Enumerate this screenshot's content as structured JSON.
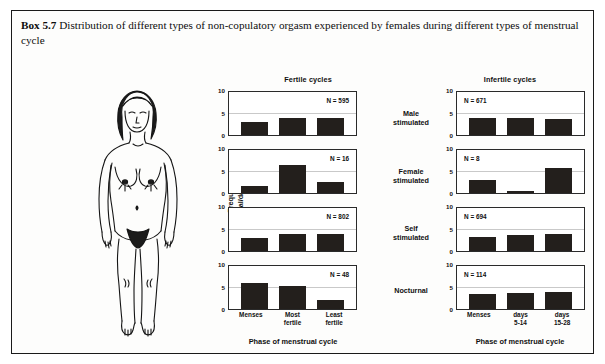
{
  "caption": {
    "label": "Box 5.7",
    "text": "Distribution of different types of non-copulatory orgasm experienced by females during different types of menstrual cycle"
  },
  "illustration": {
    "name": "standing-female-figure-line-drawing"
  },
  "chart_data": {
    "type": "bar",
    "title": "Distribution of different types of non-copulatory orgasm experienced by females during different types of menstrual cycle",
    "ylabel_line1": "Frequency",
    "ylabel_line2": "(% of total/day of phase)",
    "xlabel": "Phase of menstrual cycle",
    "ylim": [
      0,
      10
    ],
    "yticks": [
      "0",
      "5",
      "10"
    ],
    "grid": true,
    "legend": "none",
    "columns": [
      {
        "key": "fertile",
        "header": "Fertile cycles",
        "categories": [
          "Menses",
          "Most fertile",
          "Least fertile"
        ],
        "category_lines": [
          [
            "Menses",
            ""
          ],
          [
            "Most",
            "fertile"
          ],
          [
            "Least",
            "fertile"
          ]
        ],
        "xlabel": "Phase of menstrual cycle"
      },
      {
        "key": "infertile",
        "header": "Infertile cycles",
        "categories": [
          "Menses",
          "days 5-14",
          "days 15-28"
        ],
        "category_lines": [
          [
            "Menses",
            ""
          ],
          [
            "days",
            "5-14"
          ],
          [
            "days",
            "15-28"
          ]
        ],
        "xlabel": "Phase of menstrual cycle"
      }
    ],
    "rows": [
      {
        "label_line1": "Male",
        "label_line2": "stimulated",
        "panels": [
          {
            "column": "fertile",
            "n_label": "N = 595",
            "n_value": 595,
            "values": [
              3.0,
              4.0,
              4.0
            ],
            "n_align": "right"
          },
          {
            "column": "infertile",
            "n_label": "N = 671",
            "n_value": 671,
            "values": [
              4.0,
              3.9,
              3.8
            ],
            "n_align": "left"
          }
        ]
      },
      {
        "label_line1": "Female",
        "label_line2": "stimulated",
        "panels": [
          {
            "column": "fertile",
            "n_label": "N = 16",
            "n_value": 16,
            "values": [
              1.7,
              6.4,
              2.5
            ],
            "n_align": "right"
          },
          {
            "column": "infertile",
            "n_label": "N = 8",
            "n_value": 8,
            "values": [
              3.1,
              0.5,
              5.8
            ],
            "n_align": "left"
          }
        ]
      },
      {
        "label_line1": "Self",
        "label_line2": "stimulated",
        "panels": [
          {
            "column": "fertile",
            "n_label": "N = 802",
            "n_value": 802,
            "values": [
              3.0,
              4.0,
              3.9
            ],
            "n_align": "right"
          },
          {
            "column": "infertile",
            "n_label": "N = 694",
            "n_value": 694,
            "values": [
              3.3,
              3.7,
              3.9
            ],
            "n_align": "left"
          }
        ]
      },
      {
        "label_line1": "Nocturnal",
        "label_line2": "",
        "panels": [
          {
            "column": "fertile",
            "n_label": "N = 48",
            "n_value": 48,
            "values": [
              6.0,
              5.3,
              2.2
            ],
            "n_align": "right"
          },
          {
            "column": "infertile",
            "n_label": "N = 114",
            "n_value": 114,
            "values": [
              3.4,
              3.7,
              3.9
            ],
            "n_align": "left"
          }
        ]
      }
    ],
    "colors": {
      "bar": "#231f1c",
      "axis": "#2a2a2a",
      "grid": "#c9c9c9",
      "text": "#101010",
      "box_border": "#1a1a1a",
      "background": "#fdfdfc"
    }
  }
}
